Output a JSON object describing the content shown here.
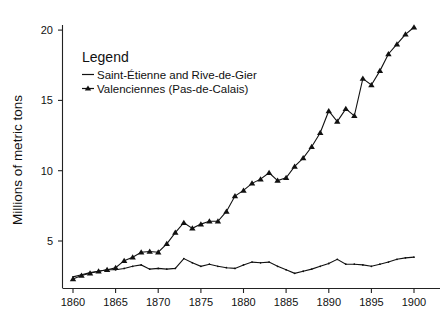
{
  "chart_data": {
    "type": "line",
    "title": "",
    "xlabel": "",
    "ylabel": "Millions of metric tons",
    "xlim": [
      1859,
      1901
    ],
    "ylim": [
      0,
      21.5
    ],
    "xticks": [
      1860,
      1865,
      1870,
      1875,
      1880,
      1885,
      1890,
      1895,
      1900
    ],
    "yticks": [
      5,
      10,
      15,
      20
    ],
    "grid": false,
    "legend": {
      "title": "Legend",
      "position": "top-left",
      "entries": [
        {
          "name": "Saint-Étienne and Rive-de-Gier",
          "marker": "line-dash",
          "color": "#111111"
        },
        {
          "name": "Valenciennes (Pas-de-Calais)",
          "marker": "triangle",
          "color": "#111111"
        }
      ]
    },
    "x": [
      1860,
      1861,
      1862,
      1863,
      1864,
      1865,
      1866,
      1867,
      1868,
      1869,
      1870,
      1871,
      1872,
      1873,
      1874,
      1875,
      1876,
      1877,
      1878,
      1879,
      1880,
      1881,
      1882,
      1883,
      1884,
      1885,
      1886,
      1887,
      1888,
      1889,
      1890,
      1891,
      1892,
      1893,
      1894,
      1895,
      1896,
      1897,
      1898,
      1899,
      1900
    ],
    "series": [
      {
        "name": "Saint-Étienne and Rive-de-Gier",
        "color": "#111111",
        "marker": "none",
        "values": [
          2.45,
          2.6,
          2.75,
          2.85,
          2.95,
          2.95,
          3.05,
          3.2,
          3.3,
          3.0,
          3.05,
          3.0,
          3.05,
          3.75,
          3.45,
          3.2,
          3.35,
          3.2,
          3.1,
          3.05,
          3.3,
          3.5,
          3.45,
          3.5,
          3.2,
          2.95,
          2.7,
          2.85,
          3.0,
          3.2,
          3.4,
          3.7,
          3.35,
          3.35,
          3.3,
          3.2,
          3.35,
          3.5,
          3.7,
          3.8,
          3.85
        ]
      },
      {
        "name": "Valenciennes (Pas-de-Calais)",
        "color": "#111111",
        "marker": "triangle",
        "values": [
          2.3,
          2.55,
          2.7,
          2.85,
          2.95,
          3.1,
          3.6,
          3.85,
          4.2,
          4.25,
          4.2,
          4.8,
          5.6,
          6.3,
          5.9,
          6.2,
          6.4,
          6.4,
          7.1,
          8.2,
          8.6,
          9.1,
          9.4,
          9.85,
          9.3,
          9.5,
          10.3,
          10.9,
          11.7,
          12.7,
          14.25,
          13.5,
          14.4,
          13.9,
          16.55,
          16.1,
          17.1,
          18.3,
          19.0,
          19.7,
          20.2
        ]
      }
    ]
  },
  "legend": {
    "title": "Legend",
    "item0": "Saint-Étienne and Rive-de-Gier",
    "item1": "Valenciennes (Pas-de-Calais)"
  },
  "axes": {
    "ylabel": "Millions of metric tons",
    "ytick0": "5",
    "ytick1": "10",
    "ytick2": "15",
    "ytick3": "20",
    "xtick0": "1860",
    "xtick1": "1865",
    "xtick2": "1870",
    "xtick3": "1875",
    "xtick4": "1880",
    "xtick5": "1885",
    "xtick6": "1890",
    "xtick7": "1895",
    "xtick8": "1900"
  }
}
